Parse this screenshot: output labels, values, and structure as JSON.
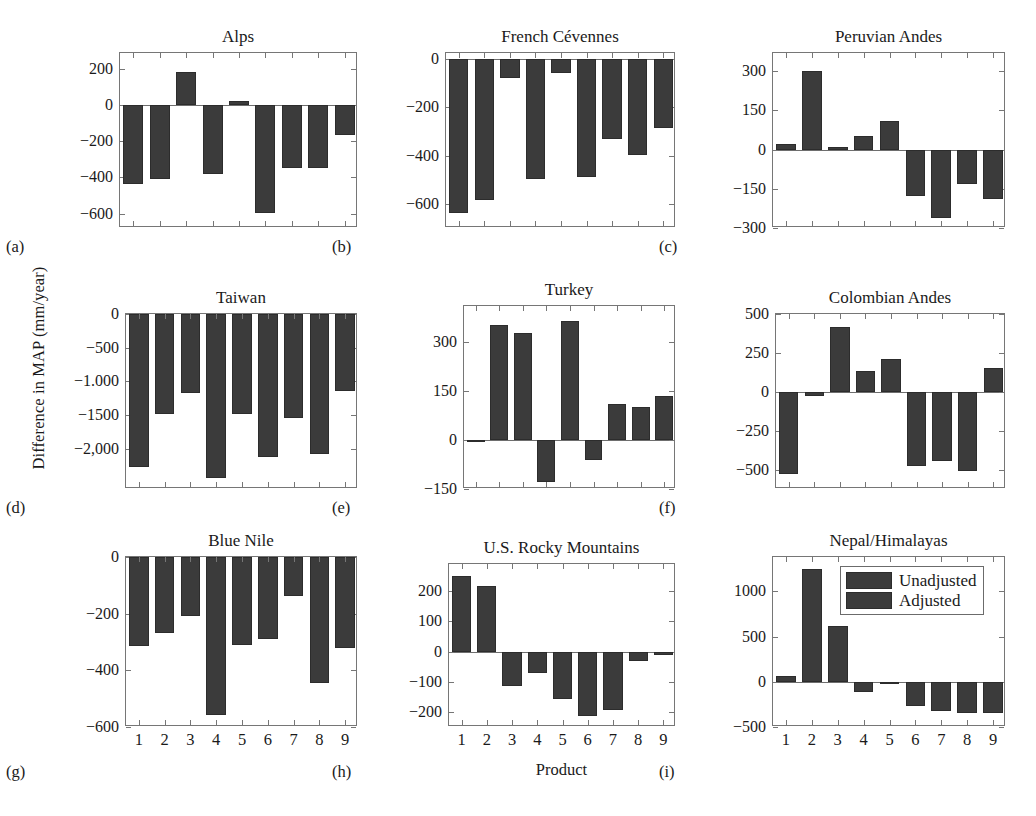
{
  "figure": {
    "ylabel": "Difference in MAP (mm/year)",
    "xlabel": "Product",
    "bar_color": "#3b3b3b",
    "axis_color": "#767676",
    "background": "#ffffff"
  },
  "legend": {
    "position": "top-right of panel (i)",
    "items": [
      {
        "label": "Unadjusted",
        "color": "#3b3b3b"
      },
      {
        "label": "Adjusted",
        "color": "#3b3b3b"
      }
    ]
  },
  "chart_data": [
    {
      "type": "bar",
      "panel": "a",
      "sublabel": "(a)",
      "title": "Alps",
      "categories": [
        "1",
        "2",
        "3",
        "4",
        "5",
        "6",
        "7",
        "8",
        "9"
      ],
      "values": [
        -437,
        -408,
        186,
        -382,
        22,
        -597,
        -348,
        -348,
        -163
      ],
      "xlabel": "",
      "ylabel": "",
      "ylim": [
        -680,
        290
      ],
      "yticks": [
        200,
        0,
        -200,
        -400,
        -600
      ],
      "ytick_labels": [
        "200",
        "0",
        "-200",
        "-400",
        "-600"
      ],
      "xtick_labels_shown": false,
      "grid": false
    },
    {
      "type": "bar",
      "panel": "b",
      "sublabel": "(b)",
      "title": "French Cévennes",
      "categories": [
        "1",
        "2",
        "3",
        "4",
        "5",
        "6",
        "7",
        "8",
        "9"
      ],
      "values": [
        -636,
        -583,
        -77,
        -497,
        -56,
        -489,
        -330,
        -396,
        -285
      ],
      "xlabel": "",
      "ylabel": "",
      "ylim": [
        -700,
        25
      ],
      "yticks": [
        0,
        -200,
        -400,
        -600
      ],
      "ytick_labels": [
        "0",
        "-200",
        "-400",
        "-600"
      ],
      "xtick_labels_shown": false,
      "grid": false
    },
    {
      "type": "bar",
      "panel": "c",
      "sublabel": "(c)",
      "title": "Peruvian Andes",
      "categories": [
        "1",
        "2",
        "3",
        "4",
        "5",
        "6",
        "7",
        "8",
        "9"
      ],
      "values": [
        22,
        303,
        10,
        52,
        110,
        -178,
        -262,
        -133,
        -190
      ],
      "xlabel": "",
      "ylabel": "",
      "ylim": [
        -300,
        370
      ],
      "yticks": [
        300,
        150,
        0,
        -150,
        -300
      ],
      "ytick_labels": [
        "300",
        "150",
        "0",
        "-150",
        "-300"
      ],
      "xtick_labels_shown": false,
      "grid": false
    },
    {
      "type": "bar",
      "panel": "d",
      "sublabel": "(d)",
      "title": "Taiwan",
      "categories": [
        "1",
        "2",
        "3",
        "4",
        "5",
        "6",
        "7",
        "8",
        "9"
      ],
      "values": [
        -2270,
        -1490,
        -1170,
        -2430,
        -1480,
        -2130,
        -1540,
        -2080,
        -1140
      ],
      "xlabel": "",
      "ylabel": "",
      "ylim": [
        -2600,
        0
      ],
      "yticks": [
        0,
        -500,
        -1000,
        -1500,
        -2000
      ],
      "ytick_labels": [
        "0",
        "-500",
        "-1.000",
        "-1500",
        "-2,000"
      ],
      "xtick_labels_shown": false,
      "grid": false
    },
    {
      "type": "bar",
      "panel": "e",
      "sublabel": "(e)",
      "title": "Turkey",
      "categories": [
        "1",
        "2",
        "3",
        "4",
        "5",
        "6",
        "7",
        "8",
        "9"
      ],
      "values": [
        -5,
        352,
        328,
        -128,
        365,
        -62,
        110,
        101,
        134
      ],
      "xlabel": "",
      "ylabel": "",
      "ylim": [
        -150,
        410
      ],
      "yticks": [
        300,
        150,
        0,
        -150
      ],
      "ytick_labels": [
        "300",
        "150",
        "0",
        "-150"
      ],
      "xtick_labels_shown": false,
      "grid": false
    },
    {
      "type": "bar",
      "panel": "f",
      "sublabel": "(f)",
      "title": "Colombian Andes",
      "categories": [
        "1",
        "2",
        "3",
        "4",
        "5",
        "6",
        "7",
        "8",
        "9"
      ],
      "values": [
        -522,
        -22,
        420,
        137,
        214,
        -470,
        -442,
        -504,
        155
      ],
      "xlabel": "",
      "ylabel": "",
      "ylim": [
        -620,
        500
      ],
      "yticks": [
        500,
        250,
        0,
        -250,
        -500
      ],
      "ytick_labels": [
        "500",
        "250",
        "0",
        "-250",
        "-500"
      ],
      "xtick_labels_shown": false,
      "grid": false
    },
    {
      "type": "bar",
      "panel": "g",
      "sublabel": "(g)",
      "title": "Blue Nile",
      "categories": [
        "1",
        "2",
        "3",
        "4",
        "5",
        "6",
        "7",
        "8",
        "9"
      ],
      "values": [
        -313,
        -267,
        -209,
        -557,
        -311,
        -288,
        -136,
        -446,
        -322
      ],
      "xlabel": "",
      "ylabel": "",
      "ylim": [
        -600,
        0
      ],
      "yticks": [
        0,
        -200,
        -400,
        -600
      ],
      "ytick_labels": [
        "0",
        "-200",
        "-400",
        "-600"
      ],
      "xtick_labels_shown": true,
      "grid": false
    },
    {
      "type": "bar",
      "panel": "h",
      "sublabel": "(h)",
      "title": "U.S. Rocky Mountains",
      "categories": [
        "1",
        "2",
        "3",
        "4",
        "5",
        "6",
        "7",
        "8",
        "9"
      ],
      "values": [
        251,
        217,
        -114,
        -71,
        -157,
        -214,
        -193,
        -30,
        -13
      ],
      "xlabel": "Product",
      "ylabel": "",
      "ylim": [
        -250,
        290
      ],
      "yticks": [
        200,
        100,
        0,
        -100,
        -200
      ],
      "ytick_labels": [
        "200",
        "100",
        "0",
        "-100",
        "-200"
      ],
      "xtick_labels_shown": true,
      "grid": false
    },
    {
      "type": "bar",
      "panel": "i",
      "sublabel": "(i)",
      "title": "Nepal/Himalayas",
      "categories": [
        "1",
        "2",
        "3",
        "4",
        "5",
        "6",
        "7",
        "8",
        "9"
      ],
      "values": [
        62,
        1250,
        620,
        -110,
        -22,
        -270,
        -320,
        -350,
        -350
      ],
      "xlabel": "",
      "ylabel": "",
      "ylim": [
        -500,
        1380
      ],
      "yticks": [
        1000,
        500,
        0,
        -500
      ],
      "ytick_labels": [
        "1000",
        "500",
        "0",
        "-500"
      ],
      "xtick_labels_shown": true,
      "grid": false
    }
  ]
}
